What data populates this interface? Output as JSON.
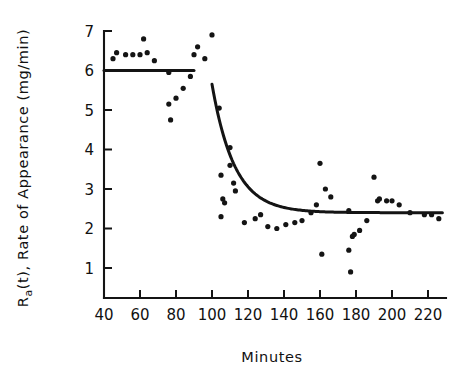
{
  "chart_data": {
    "type": "scatter",
    "title": "",
    "subtitle": "",
    "xlabel": "Minutes",
    "ylabel": "Ra(t), Rate of Appearance (mg/min)",
    "ylabel_parts": {
      "prefix": "R",
      "subscript": "a",
      "suffix": "(t), Rate of Appearance (mg/min)"
    },
    "xlim": [
      36,
      230
    ],
    "ylim": [
      0,
      7
    ],
    "xticks": [
      40,
      60,
      80,
      100,
      120,
      140,
      160,
      180,
      200,
      220
    ],
    "yticks": [
      1,
      2,
      3,
      4,
      5,
      6,
      7
    ],
    "xtick_labels": [
      "40",
      "60",
      "80",
      "100",
      "120",
      "140",
      "160",
      "180",
      "200",
      "220"
    ],
    "ytick_labels": [
      "1",
      "2",
      "3",
      "4",
      "5",
      "6",
      "7"
    ],
    "grid": false,
    "legend": false,
    "legend_position": "none",
    "point_color": "#141414",
    "curve_color": "#141414",
    "axis_color": "#141414",
    "background_color": "#ffffff",
    "series": [
      {
        "name": "Ra(t) observations",
        "type": "scatter",
        "marker": "circle",
        "points": [
          [
            45,
            6.3
          ],
          [
            47,
            6.45
          ],
          [
            52,
            6.4
          ],
          [
            56,
            6.4
          ],
          [
            60,
            6.4
          ],
          [
            62,
            6.8
          ],
          [
            64,
            6.45
          ],
          [
            68,
            6.25
          ],
          [
            76,
            5.95
          ],
          [
            76,
            5.15
          ],
          [
            77,
            4.75
          ],
          [
            80,
            5.3
          ],
          [
            84,
            5.55
          ],
          [
            88,
            5.85
          ],
          [
            90,
            6.4
          ],
          [
            92,
            6.6
          ],
          [
            96,
            6.3
          ],
          [
            100,
            6.9
          ],
          [
            104,
            5.05
          ],
          [
            105,
            3.35
          ],
          [
            106,
            2.75
          ],
          [
            107,
            2.65
          ],
          [
            105,
            2.3
          ],
          [
            110,
            4.05
          ],
          [
            110,
            3.6
          ],
          [
            112,
            3.15
          ],
          [
            113,
            2.95
          ],
          [
            118,
            2.15
          ],
          [
            124,
            2.25
          ],
          [
            127,
            2.35
          ],
          [
            131,
            2.05
          ],
          [
            136,
            2.0
          ],
          [
            141,
            2.1
          ],
          [
            146,
            2.15
          ],
          [
            150,
            2.2
          ],
          [
            155,
            2.4
          ],
          [
            158,
            2.6
          ],
          [
            160,
            3.65
          ],
          [
            161,
            1.35
          ],
          [
            163,
            3.0
          ],
          [
            166,
            2.8
          ],
          [
            176,
            2.45
          ],
          [
            176,
            1.45
          ],
          [
            177,
            0.9
          ],
          [
            178,
            1.8
          ],
          [
            179,
            1.85
          ],
          [
            182,
            1.95
          ],
          [
            186,
            2.2
          ],
          [
            190,
            3.3
          ],
          [
            192,
            2.7
          ],
          [
            193,
            2.75
          ],
          [
            197,
            2.7
          ],
          [
            200,
            2.7
          ],
          [
            204,
            2.6
          ],
          [
            210,
            2.4
          ],
          [
            218,
            2.35
          ],
          [
            222,
            2.35
          ],
          [
            226,
            2.25
          ]
        ]
      }
    ],
    "fitted_curves": [
      {
        "name": "basal plateau",
        "description": "flat baseline at 6.0 mg/min",
        "type": "line",
        "x_start": 40,
        "x_end": 90,
        "y_value": 6.0
      },
      {
        "name": "exponential decay to steady state",
        "description": "decay from 5.65 at t=100 toward asymptote 2.4 mg/min",
        "type": "exponential_decay",
        "x_start": 100,
        "x_end": 228,
        "y_start": 5.65,
        "y_asymptote": 2.4,
        "decay_constant_min": 12.5
      }
    ],
    "annotations": []
  }
}
